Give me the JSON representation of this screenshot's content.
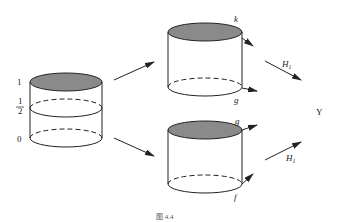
{
  "diagram": {
    "caption": "图 4.4",
    "left_cylinder": {
      "scale_labels": [
        "1",
        "1",
        "2",
        "0"
      ],
      "top_fill": "#8a8a8a"
    },
    "top_cylinder": {
      "top_label": "k",
      "bottom_label": "g",
      "top_fill": "#8a8a8a"
    },
    "bottom_cylinder": {
      "top_label": "g",
      "bottom_label": "f",
      "top_fill": "#8a8a8a"
    },
    "arrows": {
      "upper_label_main": "H",
      "upper_label_sub": "1",
      "lower_label_main": "H",
      "lower_label_sub": "1"
    },
    "target_label": "Y"
  }
}
